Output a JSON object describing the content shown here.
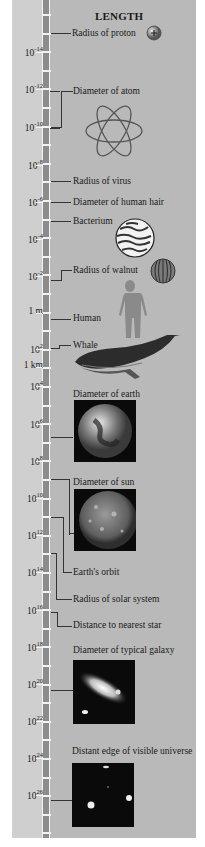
{
  "title": "LENGTH",
  "colors": {
    "panel": "#b9b9b9",
    "left_column": "#cfcfcf",
    "ruler": "#8c8c8c",
    "ticks": "#f2f2f2",
    "lines": "#333333"
  },
  "scale": {
    "ticks": [
      {
        "base": "10",
        "exp": "-14",
        "y": 52
      },
      {
        "base": "10",
        "exp": "-12",
        "y": 89
      },
      {
        "base": "10",
        "exp": "-10",
        "y": 127
      },
      {
        "base": "10",
        "exp": "-8",
        "y": 165
      },
      {
        "base": "10",
        "exp": "-6",
        "y": 202
      },
      {
        "base": "10",
        "exp": "-4",
        "y": 239
      },
      {
        "base": "10",
        "exp": "-2",
        "y": 276
      },
      {
        "base": "1 m",
        "exp": "",
        "y": 313
      },
      {
        "base": "10",
        "exp": "2",
        "y": 349
      },
      {
        "base": "1 km",
        "exp": "",
        "y": 367
      },
      {
        "base": "10",
        "exp": "4",
        "y": 386
      },
      {
        "base": "10",
        "exp": "6",
        "y": 424
      },
      {
        "base": "10",
        "exp": "8",
        "y": 461
      },
      {
        "base": "10",
        "exp": "10",
        "y": 498
      },
      {
        "base": "10",
        "exp": "12",
        "y": 535
      },
      {
        "base": "10",
        "exp": "14",
        "y": 572
      },
      {
        "base": "10",
        "exp": "16",
        "y": 610
      },
      {
        "base": "10",
        "exp": "18",
        "y": 647
      },
      {
        "base": "10",
        "exp": "20",
        "y": 684
      },
      {
        "base": "10",
        "exp": "22",
        "y": 721
      },
      {
        "base": "10",
        "exp": "24",
        "y": 758
      },
      {
        "base": "10",
        "exp": "26",
        "y": 795
      }
    ]
  },
  "objects": [
    {
      "id": "proton",
      "label": "Radius of proton",
      "icon": "proton-icon"
    },
    {
      "id": "atom",
      "label": "Diameter of atom",
      "icon": "atom-icon"
    },
    {
      "id": "virus",
      "label": "Radius of virus"
    },
    {
      "id": "hair",
      "label": "Diameter of human hair"
    },
    {
      "id": "bacterium",
      "label": "Bacterium",
      "icon": "bacterium-icon"
    },
    {
      "id": "walnut",
      "label": "Radius of walnut",
      "icon": "walnut-icon"
    },
    {
      "id": "human",
      "label": "Human",
      "icon": "human-silhouette-icon"
    },
    {
      "id": "whale",
      "label": "Whale",
      "icon": "whale-icon"
    },
    {
      "id": "earth",
      "label": "Diameter of earth",
      "icon": "earth-photo"
    },
    {
      "id": "sun",
      "label": "Diameter of sun",
      "icon": "sun-photo"
    },
    {
      "id": "earth_orbit",
      "label": "Earth's orbit"
    },
    {
      "id": "solar_system",
      "label": "Radius of  solar system"
    },
    {
      "id": "nearest_star",
      "label": "Distance to nearest star"
    },
    {
      "id": "galaxy",
      "label": "Diameter of typical galaxy",
      "icon": "galaxy-photo"
    },
    {
      "id": "universe",
      "label": "Distant edge of visible universe",
      "icon": "universe-photo"
    }
  ]
}
